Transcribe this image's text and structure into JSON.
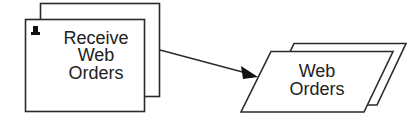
{
  "diagram": {
    "process": {
      "label_lines": [
        "Receive",
        "Web",
        "Orders"
      ],
      "icon": "pin-icon",
      "stacked": true
    },
    "data_store": {
      "label_lines": [
        "Web",
        "Orders"
      ],
      "shape": "parallelogram",
      "stacked": true
    },
    "connector": {
      "from": "data_store",
      "to": "process",
      "arrowhead_at": "data_store"
    },
    "colors": {
      "stroke": "#2a2a2a",
      "fill": "#ffffff",
      "text": "#222222"
    }
  }
}
